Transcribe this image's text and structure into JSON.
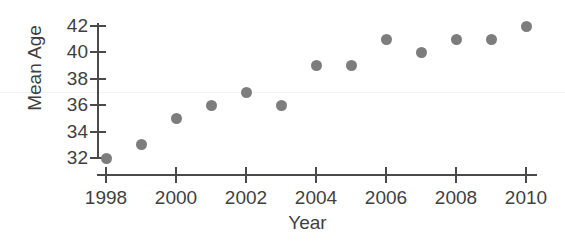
{
  "chart_data": {
    "type": "scatter",
    "title": "",
    "xlabel": "Year",
    "ylabel": "Mean Age",
    "x": [
      1998,
      1999,
      2000,
      2001,
      2002,
      2003,
      2004,
      2005,
      2006,
      2007,
      2008,
      2009,
      2010
    ],
    "values": [
      32,
      33,
      35,
      36,
      37,
      36,
      39,
      39,
      41,
      40,
      41,
      41,
      42
    ],
    "series": [
      {
        "name": "Mean Age",
        "values": [
          32,
          33,
          35,
          36,
          37,
          36,
          39,
          39,
          41,
          40,
          41,
          41,
          42
        ]
      }
    ],
    "xlim": [
      1998,
      2010
    ],
    "ylim": [
      32,
      42
    ],
    "xticks": [
      1998,
      2000,
      2002,
      2004,
      2006,
      2008,
      2010
    ],
    "xticklabels": [
      "1998",
      "2000",
      "2002",
      "2004",
      "2006",
      "2008",
      "2010"
    ],
    "yticks": [
      32,
      34,
      36,
      38,
      40,
      42
    ],
    "yticklabels": [
      "32",
      "34",
      "36",
      "38",
      "40",
      "42"
    ],
    "grid": false,
    "legend": null,
    "marker_color": "#7d7d7d",
    "axis_color": "#4a4a4a"
  }
}
